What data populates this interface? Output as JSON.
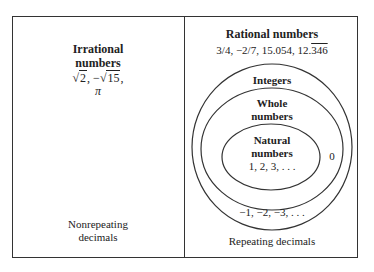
{
  "irrational": {
    "title_line1": "Irrational",
    "title_line2": "numbers",
    "examples": {
      "sqrt_symbol": "√",
      "ex1_radicand": "2",
      "sep": ", ",
      "ex2_prefix": "−",
      "ex2_radicand": "15",
      "trailing": ",",
      "ex3": "π"
    },
    "footer_line1": "Nonrepeating",
    "footer_line2": "decimals"
  },
  "rational": {
    "title": "Rational numbers",
    "examples_prefix": "3/4, −2/7, 15.054, 12.",
    "examples_repeating": "346",
    "footer": "Repeating decimals",
    "integers": {
      "title": "Integers",
      "examples": "−1, −2, −3, . . ."
    },
    "whole": {
      "title_line1": "Whole",
      "title_line2": "numbers",
      "examples": "0"
    },
    "natural": {
      "title_line1": "Natural",
      "title_line2": "numbers",
      "examples": "1, 2, 3, . . ."
    }
  },
  "colors": {
    "stroke": "#333333",
    "text": "#222222",
    "background": "#ffffff"
  }
}
